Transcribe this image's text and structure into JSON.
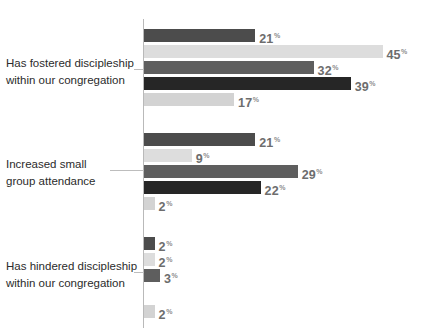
{
  "chart_data": {
    "type": "bar",
    "orientation": "horizontal",
    "title": "",
    "subtitle": "",
    "xlabel": "",
    "ylabel": "",
    "grid": false,
    "legend": "none",
    "xlim": [
      0,
      48
    ],
    "value_suffix": "%",
    "categories": [
      "Has fostered discipleship within our congregation",
      "Increased small group attendance",
      "Has hindered discipleship within our congregation"
    ],
    "category_label_lines": [
      [
        "Has fostered discipleship",
        "within our congregation"
      ],
      [
        "Increased small",
        "group attendance"
      ],
      [
        "Has hindered discipleship",
        "within our congregation"
      ]
    ],
    "series": [
      {
        "name": "series-1",
        "color": "#4c4c4c",
        "values": [
          21,
          21,
          2
        ]
      },
      {
        "name": "series-2",
        "color": "#dddddd",
        "values": [
          45,
          9,
          2
        ]
      },
      {
        "name": "series-3",
        "color": "#5e5e5e",
        "values": [
          32,
          29,
          3
        ]
      },
      {
        "name": "series-4",
        "color": "#262626",
        "values": [
          39,
          22,
          0
        ]
      },
      {
        "name": "series-5",
        "color": "#d3d3d3",
        "values": [
          17,
          2,
          2
        ]
      }
    ],
    "bars": [
      {
        "group": 0,
        "series": 0,
        "value": 21,
        "label": "21",
        "suffix": "%",
        "color": "#4c4c4c",
        "y": 29
      },
      {
        "group": 0,
        "series": 1,
        "value": 45,
        "label": "45",
        "suffix": "%",
        "color": "#dddddd",
        "y": 45
      },
      {
        "group": 0,
        "series": 2,
        "value": 32,
        "label": "32",
        "suffix": "%",
        "color": "#5e5e5e",
        "y": 61
      },
      {
        "group": 0,
        "series": 3,
        "value": 39,
        "label": "39",
        "suffix": "%",
        "color": "#262626",
        "y": 77
      },
      {
        "group": 0,
        "series": 4,
        "value": 17,
        "label": "17",
        "suffix": "%",
        "color": "#d3d3d3",
        "y": 93
      },
      {
        "group": 1,
        "series": 0,
        "value": 21,
        "label": "21",
        "suffix": "%",
        "color": "#4c4c4c",
        "y": 133
      },
      {
        "group": 1,
        "series": 1,
        "value": 9,
        "label": "9",
        "suffix": "%",
        "color": "#dddddd",
        "y": 149
      },
      {
        "group": 1,
        "series": 2,
        "value": 29,
        "label": "29",
        "suffix": "%",
        "color": "#5e5e5e",
        "y": 165
      },
      {
        "group": 1,
        "series": 3,
        "value": 22,
        "label": "22",
        "suffix": "%",
        "color": "#262626",
        "y": 181
      },
      {
        "group": 1,
        "series": 4,
        "value": 2,
        "label": "2",
        "suffix": "%",
        "color": "#d3d3d3",
        "y": 197
      },
      {
        "group": 2,
        "series": 0,
        "value": 2,
        "label": "2",
        "suffix": "%",
        "color": "#4c4c4c",
        "y": 237
      },
      {
        "group": 2,
        "series": 1,
        "value": 2,
        "label": "2",
        "suffix": "%",
        "color": "#dddddd",
        "y": 253
      },
      {
        "group": 2,
        "series": 2,
        "value": 3,
        "label": "3",
        "suffix": "%",
        "color": "#5e5e5e",
        "y": 269
      },
      {
        "group": 2,
        "series": 3,
        "value": 0,
        "label": "",
        "suffix": "",
        "color": "#262626",
        "y": 285
      },
      {
        "group": 2,
        "series": 4,
        "value": 2,
        "label": "2",
        "suffix": "%",
        "color": "#d3d3d3",
        "y": 305
      }
    ],
    "axis": {
      "x_px": 143,
      "top_px": 19,
      "height_px": 309,
      "px_per_unit": 5.3,
      "color": "#b9b9b9"
    },
    "category_positions": [
      {
        "label_top": 55,
        "leader_y": 69,
        "leader_left": 134,
        "leader_width": 10
      },
      {
        "label_top": 156,
        "leader_y": 170,
        "leader_left": 110,
        "leader_width": 34
      },
      {
        "label_top": 258,
        "leader_y": 272,
        "leader_left": 134,
        "leader_width": 10
      }
    ]
  }
}
